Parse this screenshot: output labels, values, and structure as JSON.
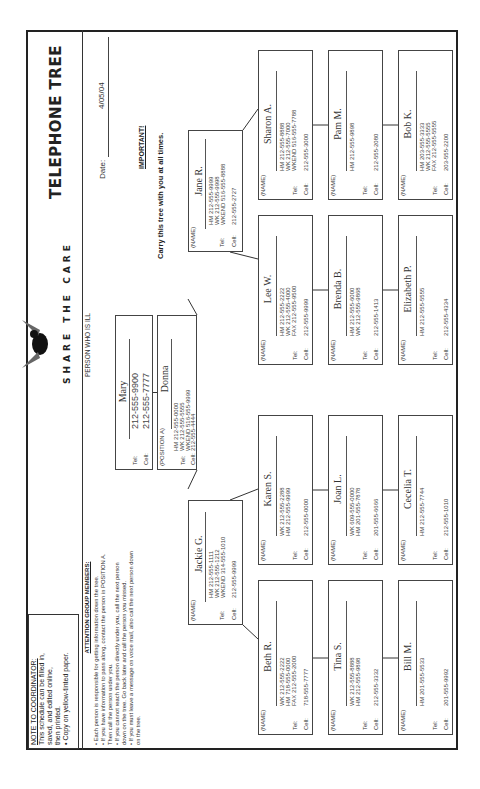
{
  "document": {
    "title": "TELEPHONE TREE",
    "date_label": "Date:",
    "date_value": "4/05/04",
    "important_label": "IMPORTANT!",
    "important_text": "Carry this tree with you at all times.",
    "brand": "SHARE THE CARE",
    "brand_icon": "bird-logo-icon"
  },
  "coordinator_note": {
    "heading": "NOTE TO COORDINATOR:",
    "lines": [
      "This schedule can be filled in,",
      "saved, and edited online,",
      "then printed."
    ],
    "bullet": "• Copy on yellow-tinted paper."
  },
  "attention": {
    "heading": "ATTENTION GROUP MEMBERS:",
    "items": [
      "• Each person is responsible for getting information down the tree.",
      "• If you have information to pass along, contact the person in POSITION A.",
      "   Then call the person under you.",
      "• If you cannot reach the person directly under you, call the next person",
      "   down on the tree. Go back later and call the person you missed.",
      "• If you must leave a message on voice mail, also call the next person down",
      "   on the tree."
    ]
  },
  "ill_person": {
    "label": "PERSON WHO IS ILL",
    "name": "Mary",
    "tel_label": "Tel:",
    "tel": "212-555-9900",
    "cell_label": "Cell:",
    "cell": "212-555-7777"
  },
  "labels": {
    "name": "(NAME)",
    "position_a": "(POSITION A)",
    "tel": "Tel:",
    "cell": "Cell:"
  },
  "position_a": {
    "name": "Donna",
    "phones": [
      "HM 212-555-0000",
      "WK 212-555-5555",
      "WKEND 516-555-9999"
    ],
    "cell": "212-555-4444"
  },
  "branches": [
    {
      "leader": {
        "name": "Jane R.",
        "phones": [
          "HM 212-555-9999",
          "WK 212-555-9998",
          "WKEND 516-555-8888"
        ],
        "cell": "212-555-2727"
      },
      "rows": [
        [
          {
            "name": "Sharon A.",
            "phones": [
              "HM 212-555-8888",
              "WK 212-555-7000",
              "WKEND 516-555-7788"
            ],
            "cell": "212-555-3000"
          },
          {
            "name": "Pam M.",
            "phones": [
              "HM 212-555-9898"
            ],
            "cell": "212-555-2080"
          },
          {
            "name": "Bob K.",
            "phones": [
              "HM 203-555-3333",
              "WK 212-555-5555",
              "FAX 212-555-5555"
            ],
            "cell": "203-555-2200"
          }
        ],
        [
          {
            "name": "Lee W.",
            "phones": [
              "HM 212-555-2222",
              "WK 212-555-4000",
              "FAX 212-555-9500"
            ],
            "cell": "212-555-9999"
          },
          {
            "name": "Brenda B.",
            "phones": [
              "HM 212-555-6000",
              "WK 212-555-9868"
            ],
            "cell": "212-555-1413"
          },
          {
            "name": "Elizabeth P.",
            "phones": [
              "HM 212-555-5555"
            ],
            "cell": "212-555-4334"
          }
        ]
      ]
    },
    {
      "leader": {
        "name": "Jackie G.",
        "phones": [
          "HM 212-555-1111",
          "WK 212-555-1212",
          "WKEND 314-555-1010"
        ],
        "cell": "212-555-9999"
      },
      "rows": [
        [
          {
            "name": "Karen S.",
            "phones": [
              "WK 212-555-2288",
              "HM 212-555-9999"
            ],
            "cell": "212-555-0000"
          },
          {
            "name": "Joan L.",
            "phones": [
              "WK 609-555-0000",
              "HM 201-555-7878"
            ],
            "cell": "201-555-6666"
          },
          {
            "name": "Cecelia T.",
            "phones": [
              "HM 212-555-7744"
            ],
            "cell": "212-555-1010"
          }
        ],
        [
          {
            "name": "Beth R.",
            "phones": [
              "WK 212-555-2222",
              "HM 718-555-0000",
              "FAX 212-555-2000"
            ],
            "cell": "718-555-7777"
          },
          {
            "name": "Tina S.",
            "phones": [
              "WK 212-555-8888",
              "HM 212-555-9898"
            ],
            "cell": "212-555-3332"
          },
          {
            "name": "Bill M.",
            "phones": [
              "HM 201-555-5533"
            ],
            "cell": "201-555-9992"
          }
        ]
      ]
    }
  ]
}
